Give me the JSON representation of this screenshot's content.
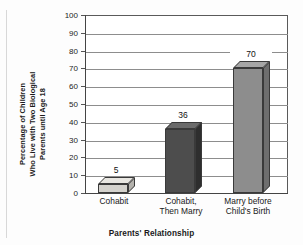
{
  "chart_data": {
    "type": "bar",
    "title": "",
    "categories": [
      "Cohabit",
      "Cohabit,\nThen Marry",
      "Marry before\nChild's Birth"
    ],
    "category_lines": [
      [
        "Cohabit"
      ],
      [
        "Cohabit,",
        "Then Marry"
      ],
      [
        "Marry before",
        "Child's Birth"
      ]
    ],
    "values": [
      5,
      36,
      70
    ],
    "value_labels": [
      "5",
      "36",
      "70"
    ],
    "xlabel": "Parents' Relationship",
    "ylabel_lines": [
      "Percentage of Children",
      "Who Live with Two Biological",
      "Parents until Age 18"
    ],
    "ylim": [
      0,
      100
    ],
    "ytick_values": [
      0,
      10,
      20,
      30,
      40,
      50,
      60,
      70,
      80,
      90,
      100
    ],
    "ytick_labels": [
      "0",
      "10",
      "20",
      "30",
      "40",
      "50",
      "60",
      "70",
      "80",
      "90",
      "100"
    ],
    "grid": true,
    "grid_axis": "y",
    "legend": "none",
    "bar_colors": [
      "#d4d2cd",
      "#4d4d4d",
      "#8d8d8d"
    ],
    "bar_top_colors": [
      "#e8e6e1",
      "#6b6b6b",
      "#a6a6a6"
    ],
    "bar_side_colors": [
      "#b4b2ad",
      "#2e2e2e",
      "#6e6e6e"
    ],
    "style_3d": true
  }
}
